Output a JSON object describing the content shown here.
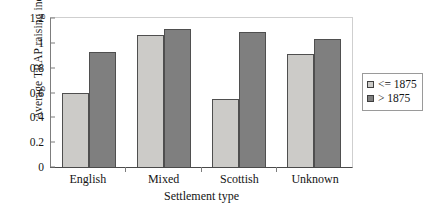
{
  "chart_data": {
    "type": "bar",
    "title": "",
    "xlabel": "Settlement type",
    "ylabel": "Average TRAP raising index",
    "categories": [
      "English",
      "Mixed",
      "Scottish",
      "Unknown"
    ],
    "series": [
      {
        "name": "<= 1875",
        "color": "#cccbc8",
        "values": [
          0.6,
          1.065,
          0.55,
          0.91
        ]
      },
      {
        "name": "> 1875",
        "color": "#7f7f7f",
        "values": [
          0.93,
          1.115,
          1.085,
          1.03
        ]
      }
    ],
    "ylim": [
      0,
      1.2
    ],
    "yticks": [
      0,
      0.2,
      0.4,
      0.6,
      0.8,
      1,
      1.2
    ],
    "ytick_labels": [
      "0",
      "0.2",
      "0.4",
      "0.6",
      "0.8",
      "1",
      "1.2"
    ],
    "grid": false,
    "legend_position": "right"
  },
  "legend": {
    "items": [
      {
        "label": "<= 1875"
      },
      {
        "label": "> 1875"
      }
    ]
  }
}
